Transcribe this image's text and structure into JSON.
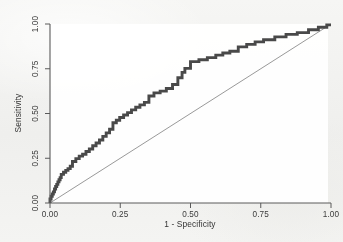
{
  "figure": {
    "background_color": "#f2f2f0",
    "plot_background_color": "#ffffff",
    "curve_color": "#4a4a4a",
    "reference_line_color": "#8d8d8d",
    "axis_color": "#5a5a5a"
  },
  "axes": {
    "x_title": "1 - Specificity",
    "y_title": "Sensitivity",
    "x_ticks": [
      "0.00",
      "0.25",
      "0.50",
      "0.75",
      "1.00"
    ],
    "y_ticks": [
      "0.00",
      "0.25",
      "0.50",
      "0.75",
      "1.00"
    ]
  },
  "chart_data": {
    "type": "line",
    "title": "",
    "subtitle": "",
    "xlabel": "1 - Specificity",
    "ylabel": "Sensitivity",
    "xlim": [
      0.0,
      1.0
    ],
    "ylim": [
      0.0,
      1.0
    ],
    "grid": false,
    "legend": "none",
    "xticks": [
      0.0,
      0.25,
      0.5,
      0.75,
      1.0
    ],
    "yticks": [
      0.0,
      0.25,
      0.5,
      0.75,
      1.0
    ],
    "xticklabels": [
      "0.00",
      "0.25",
      "0.50",
      "0.75",
      "1.00"
    ],
    "yticklabels": [
      "0.00",
      "0.25",
      "0.50",
      "0.75",
      "1.00"
    ],
    "series": [
      {
        "name": "ROC curve",
        "style": "step",
        "color": "#4a4a4a",
        "linewidth": 3,
        "x": [
          0.0,
          0.0,
          0.004,
          0.004,
          0.008,
          0.008,
          0.012,
          0.012,
          0.016,
          0.016,
          0.02,
          0.02,
          0.024,
          0.024,
          0.028,
          0.028,
          0.032,
          0.032,
          0.036,
          0.036,
          0.04,
          0.04,
          0.048,
          0.048,
          0.056,
          0.056,
          0.064,
          0.064,
          0.072,
          0.072,
          0.08,
          0.08,
          0.092,
          0.092,
          0.104,
          0.104,
          0.116,
          0.116,
          0.128,
          0.128,
          0.14,
          0.14,
          0.152,
          0.152,
          0.164,
          0.164,
          0.176,
          0.176,
          0.188,
          0.188,
          0.2,
          0.2,
          0.212,
          0.212,
          0.224,
          0.224,
          0.236,
          0.236,
          0.248,
          0.248,
          0.262,
          0.262,
          0.276,
          0.276,
          0.29,
          0.29,
          0.305,
          0.305,
          0.32,
          0.32,
          0.336,
          0.336,
          0.352,
          0.352,
          0.37,
          0.37,
          0.392,
          0.392,
          0.414,
          0.414,
          0.436,
          0.436,
          0.455,
          0.455,
          0.47,
          0.47,
          0.48,
          0.48,
          0.5,
          0.5,
          0.53,
          0.53,
          0.56,
          0.56,
          0.59,
          0.59,
          0.615,
          0.615,
          0.64,
          0.64,
          0.67,
          0.67,
          0.7,
          0.7,
          0.73,
          0.73,
          0.76,
          0.76,
          0.8,
          0.8,
          0.84,
          0.84,
          0.88,
          0.88,
          0.92,
          0.92,
          0.955,
          0.955,
          0.985,
          0.985,
          1.0
        ],
        "y": [
          0.0,
          0.022,
          0.022,
          0.038,
          0.038,
          0.05,
          0.05,
          0.062,
          0.062,
          0.078,
          0.078,
          0.092,
          0.092,
          0.104,
          0.104,
          0.118,
          0.118,
          0.13,
          0.13,
          0.142,
          0.142,
          0.16,
          0.16,
          0.172,
          0.172,
          0.182,
          0.182,
          0.192,
          0.192,
          0.205,
          0.205,
          0.232,
          0.232,
          0.248,
          0.248,
          0.262,
          0.262,
          0.272,
          0.272,
          0.288,
          0.288,
          0.302,
          0.302,
          0.32,
          0.32,
          0.335,
          0.335,
          0.352,
          0.352,
          0.372,
          0.372,
          0.392,
          0.392,
          0.412,
          0.412,
          0.448,
          0.448,
          0.462,
          0.462,
          0.478,
          0.478,
          0.492,
          0.492,
          0.505,
          0.505,
          0.52,
          0.52,
          0.535,
          0.535,
          0.548,
          0.548,
          0.562,
          0.562,
          0.598,
          0.598,
          0.615,
          0.615,
          0.625,
          0.625,
          0.64,
          0.64,
          0.662,
          0.662,
          0.7,
          0.7,
          0.73,
          0.73,
          0.752,
          0.752,
          0.79,
          0.79,
          0.8,
          0.8,
          0.812,
          0.812,
          0.826,
          0.826,
          0.838,
          0.838,
          0.848,
          0.848,
          0.872,
          0.872,
          0.886,
          0.886,
          0.9,
          0.9,
          0.912,
          0.912,
          0.928,
          0.928,
          0.942,
          0.942,
          0.952,
          0.952,
          0.968,
          0.968,
          0.982,
          0.982,
          0.995,
          0.995
        ]
      },
      {
        "name": "Reference line",
        "style": "line",
        "color": "#8d8d8d",
        "linewidth": 1,
        "x": [
          0.0,
          1.0
        ],
        "y": [
          0.0,
          1.0
        ]
      }
    ]
  }
}
